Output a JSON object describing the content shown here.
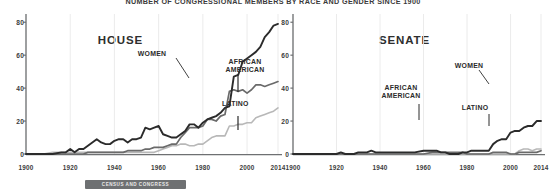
{
  "figure": {
    "title": "NUMBER OF CONGRESSIONAL MEMBERS BY RACE AND GENDER SINCE 1900",
    "caption": "CENSUS AND CONGRESS",
    "colors": {
      "women": "#2b2b2b",
      "african_american": "#6a6a6a",
      "latino": "#b8b8b8",
      "axis": "#6e7072",
      "grid": "#e9e9e9",
      "text": "#2b2b2b"
    }
  },
  "chart_data": [
    {
      "type": "line",
      "title": "HOUSE",
      "xlabel": "",
      "ylabel": "",
      "xlim": [
        1900,
        2014
      ],
      "ylim": [
        0,
        85
      ],
      "grid": true,
      "legend_position": "inline-annotations",
      "xticks": [
        "1900",
        "1920",
        "1940",
        "1960",
        "1980",
        "2000",
        "2014"
      ],
      "yticks": [
        "0",
        "20",
        "40",
        "60",
        "80"
      ],
      "annotations": [
        {
          "label": "WOMEN",
          "series": "Women"
        },
        {
          "label": "AFRICAN AMERICAN",
          "series": "African American"
        },
        {
          "label": "LATINO",
          "series": "Latino"
        }
      ],
      "x": [
        1900,
        1904,
        1908,
        1912,
        1916,
        1918,
        1920,
        1922,
        1924,
        1926,
        1928,
        1930,
        1932,
        1934,
        1936,
        1938,
        1940,
        1942,
        1944,
        1946,
        1948,
        1950,
        1952,
        1954,
        1956,
        1958,
        1960,
        1962,
        1964,
        1966,
        1968,
        1970,
        1972,
        1974,
        1976,
        1978,
        1980,
        1982,
        1984,
        1986,
        1988,
        1990,
        1992,
        1994,
        1996,
        1998,
        2000,
        2002,
        2004,
        2006,
        2008,
        2010,
        2012,
        2014
      ],
      "series": [
        {
          "name": "Women",
          "color": "#2b2b2b",
          "values": [
            0,
            0,
            0,
            0,
            1,
            1,
            3,
            1,
            3,
            3,
            5,
            7,
            9,
            7,
            6,
            6,
            8,
            9,
            9,
            7,
            9,
            9,
            10,
            16,
            15,
            16,
            17,
            12,
            11,
            10,
            10,
            12,
            14,
            18,
            18,
            16,
            19,
            21,
            22,
            23,
            25,
            28,
            29,
            47,
            48,
            56,
            58,
            60,
            62,
            65,
            71,
            74,
            78,
            79,
            81,
            84
          ]
        },
        {
          "name": "African American",
          "color": "#6a6a6a",
          "values": [
            0,
            0,
            0,
            0,
            0,
            0,
            0,
            0,
            0,
            0,
            1,
            1,
            1,
            1,
            1,
            1,
            1,
            1,
            1,
            2,
            2,
            2,
            2,
            3,
            3,
            4,
            4,
            4,
            5,
            6,
            6,
            10,
            13,
            16,
            16,
            16,
            17,
            21,
            21,
            20,
            23,
            24,
            38,
            39,
            38,
            39,
            37,
            39,
            42,
            42,
            41,
            42,
            43,
            44,
            45,
            46
          ]
        },
        {
          "name": "Latino",
          "color": "#b8b8b8",
          "values": [
            0,
            0,
            0,
            1,
            1,
            1,
            1,
            1,
            1,
            1,
            1,
            1,
            1,
            1,
            1,
            1,
            1,
            1,
            1,
            1,
            1,
            1,
            1,
            1,
            1,
            1,
            2,
            3,
            4,
            5,
            5,
            6,
            6,
            5,
            5,
            6,
            6,
            8,
            10,
            11,
            11,
            11,
            17,
            17,
            18,
            18,
            19,
            19,
            22,
            23,
            24,
            25,
            26,
            28,
            29,
            30
          ]
        }
      ]
    },
    {
      "type": "line",
      "title": "SENATE",
      "xlabel": "",
      "ylabel": "",
      "xlim": [
        1900,
        2014
      ],
      "ylim": [
        0,
        85
      ],
      "grid": true,
      "legend_position": "inline-annotations",
      "xticks": [
        "1900",
        "1920",
        "1940",
        "1960",
        "1980",
        "2000",
        "2014"
      ],
      "yticks": [
        "0",
        "20",
        "40",
        "60",
        "80"
      ],
      "annotations": [
        {
          "label": "WOMEN",
          "series": "Women"
        },
        {
          "label": "AFRICAN AMERICAN",
          "series": "African American"
        },
        {
          "label": "LATINO",
          "series": "Latino"
        }
      ],
      "x": [
        1900,
        1904,
        1908,
        1912,
        1916,
        1920,
        1922,
        1924,
        1928,
        1930,
        1932,
        1934,
        1936,
        1938,
        1940,
        1944,
        1948,
        1952,
        1956,
        1960,
        1964,
        1966,
        1968,
        1970,
        1972,
        1974,
        1976,
        1978,
        1980,
        1982,
        1984,
        1986,
        1988,
        1990,
        1992,
        1994,
        1996,
        1998,
        2000,
        2002,
        2004,
        2006,
        2008,
        2010,
        2012,
        2014
      ],
      "series": [
        {
          "name": "Women",
          "color": "#2b2b2b",
          "values": [
            0,
            0,
            0,
            0,
            0,
            0,
            1,
            0,
            0,
            1,
            1,
            1,
            2,
            1,
            1,
            1,
            1,
            1,
            1,
            2,
            2,
            2,
            1,
            1,
            0,
            0,
            0,
            1,
            1,
            2,
            2,
            2,
            2,
            2,
            6,
            8,
            9,
            9,
            13,
            14,
            14,
            16,
            17,
            17,
            20,
            20
          ]
        },
        {
          "name": "African American",
          "color": "#6a6a6a",
          "values": [
            0,
            0,
            0,
            0,
            0,
            0,
            0,
            0,
            0,
            0,
            0,
            0,
            0,
            0,
            0,
            0,
            0,
            0,
            0,
            0,
            1,
            1,
            1,
            1,
            1,
            1,
            1,
            1,
            0,
            0,
            0,
            0,
            0,
            0,
            1,
            1,
            1,
            1,
            0,
            0,
            1,
            1,
            1,
            1,
            1,
            2
          ]
        },
        {
          "name": "Latino",
          "color": "#b8b8b8",
          "values": [
            0,
            0,
            0,
            0,
            0,
            0,
            0,
            0,
            0,
            0,
            0,
            0,
            0,
            0,
            0,
            0,
            0,
            0,
            0,
            0,
            0,
            0,
            0,
            0,
            0,
            0,
            0,
            0,
            0,
            0,
            0,
            0,
            0,
            0,
            0,
            0,
            0,
            0,
            0,
            0,
            2,
            3,
            3,
            2,
            3,
            3
          ]
        }
      ]
    }
  ]
}
